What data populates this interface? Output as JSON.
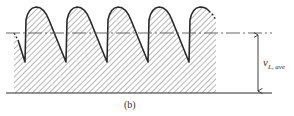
{
  "figure": {
    "caption": "(b)",
    "voltage_label": {
      "main": "v",
      "subscript": "L, ave"
    }
  },
  "colors": {
    "line": "#2a2a2a",
    "hatch": "#6f6f6f",
    "dash": "#555555",
    "background": "#ffffff"
  },
  "geometry": {
    "baseline_y": 93,
    "average_y": 33,
    "peak_y": 7,
    "trough_y": 62,
    "period_px": 41,
    "cycles": 5
  }
}
